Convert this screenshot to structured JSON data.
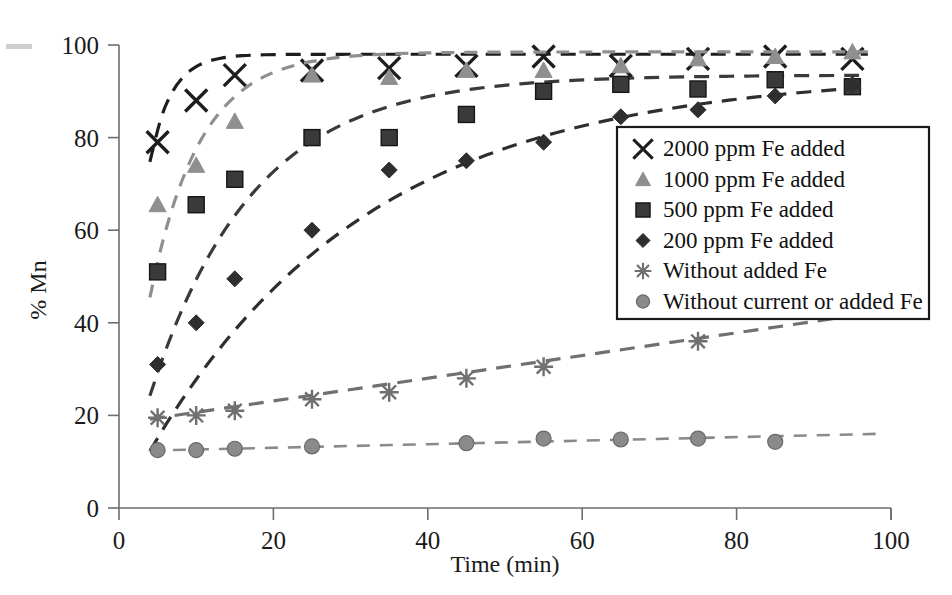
{
  "chart_data": {
    "type": "line",
    "title": "",
    "xlabel": "Time (min)",
    "ylabel": "% Mn",
    "xlim": [
      0,
      100
    ],
    "ylim": [
      0,
      100
    ],
    "xticks": [
      0,
      20,
      40,
      60,
      80,
      100
    ],
    "yticks": [
      0,
      20,
      40,
      60,
      80,
      100
    ],
    "grid": false,
    "legend_position": "center-right",
    "x": [
      5,
      10,
      15,
      25,
      35,
      45,
      55,
      65,
      75,
      85,
      95
    ],
    "series": [
      {
        "name": "2000 ppm Fe added",
        "marker": "x-cross",
        "color": "#1d1d1d",
        "values": [
          79,
          88,
          93.5,
          94.5,
          95,
          95.5,
          97.5,
          95.5,
          97,
          97.5,
          97
        ]
      },
      {
        "name": "1000 ppm Fe added",
        "marker": "triangle",
        "color": "#8f8f8f",
        "values": [
          65.5,
          74,
          83.5,
          93.5,
          93,
          94.5,
          94.5,
          95.5,
          97,
          97.5,
          98.5
        ]
      },
      {
        "name": "500 ppm Fe added",
        "marker": "square",
        "color": "#3a3a3a",
        "values": [
          51,
          65.5,
          71,
          80,
          80,
          85,
          90,
          91.5,
          90.5,
          92.5,
          91
        ]
      },
      {
        "name": "200 ppm Fe added",
        "marker": "diamond",
        "color": "#2e2e2e",
        "values": [
          31,
          40,
          49.5,
          60,
          73,
          75,
          79,
          84.5,
          86,
          89,
          91.5
        ]
      },
      {
        "name": "Without added Fe",
        "marker": "asterisk",
        "color": "#707070",
        "values": [
          19.5,
          20,
          21,
          23.5,
          25,
          28,
          30.5,
          null,
          36,
          null,
          null
        ]
      },
      {
        "name": "Without current or added Fe",
        "marker": "circle",
        "color": "#8a8a8a",
        "values": [
          12.5,
          12.5,
          12.8,
          13.3,
          null,
          14,
          15,
          14.8,
          15,
          14.3,
          null
        ]
      }
    ]
  },
  "legend": {
    "items": [
      {
        "label": "2000 ppm Fe added",
        "marker": "x-cross",
        "color": "#1d1d1d"
      },
      {
        "label": "1000 ppm Fe added",
        "marker": "triangle",
        "color": "#8f8f8f"
      },
      {
        "label": "500 ppm Fe added",
        "marker": "square",
        "color": "#3a3a3a"
      },
      {
        "label": "200 ppm Fe added",
        "marker": "diamond",
        "color": "#2e2e2e"
      },
      {
        "label": "Without added Fe",
        "marker": "asterisk",
        "color": "#707070"
      },
      {
        "label": "Without current or added Fe",
        "marker": "circle",
        "color": "#8a8a8a"
      }
    ]
  },
  "axes": {
    "x_title": "Time (min)",
    "y_title": "% Mn",
    "x_tick_labels": [
      "0",
      "20",
      "40",
      "60",
      "80",
      "100"
    ],
    "y_tick_labels": [
      "0",
      "20",
      "40",
      "60",
      "80",
      "100"
    ]
  },
  "trend_lines": {
    "without_added_fe_end": 42,
    "without_current_end": 16
  }
}
